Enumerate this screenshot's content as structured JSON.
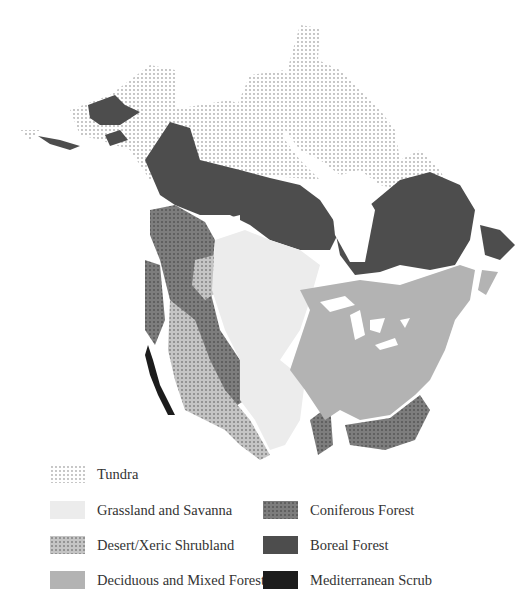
{
  "map": {
    "region": "North America",
    "description": "Biome map of North America"
  },
  "legend": {
    "items": [
      {
        "id": "tundra",
        "label": "Tundra",
        "color": "#ffffff",
        "pattern": "sparse-dots"
      },
      {
        "id": "grassland",
        "label": "Grassland and Savanna",
        "color": "#ececec",
        "pattern": "solid"
      },
      {
        "id": "desert",
        "label": "Desert/Xeric Shrubland",
        "color": "#c4c4c4",
        "pattern": "dense-dots"
      },
      {
        "id": "deciduous",
        "label": "Deciduous and Mixed Forest",
        "color": "#b3b3b3",
        "pattern": "solid"
      },
      {
        "id": "coniferous",
        "label": "Coniferous Forest",
        "color": "#7d7d7d",
        "pattern": "dense-dots"
      },
      {
        "id": "boreal",
        "label": "Boreal Forest",
        "color": "#4d4d4d",
        "pattern": "solid"
      },
      {
        "id": "mediterranean",
        "label": "Mediterranean Scrub",
        "color": "#1c1c1c",
        "pattern": "solid"
      }
    ]
  }
}
